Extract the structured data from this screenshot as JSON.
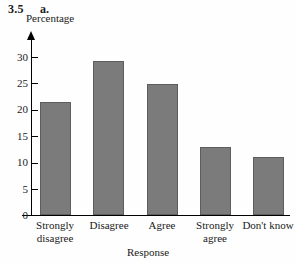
{
  "exercise": {
    "number": "3.5",
    "part": "a."
  },
  "chart_data": {
    "type": "bar",
    "title": "",
    "categories": [
      "Strongly disagree",
      "Disagree",
      "Agree",
      "Strongly agree",
      "Don't know"
    ],
    "category_lines": [
      [
        "Strongly",
        "disagree"
      ],
      [
        "Disagree",
        ""
      ],
      [
        "Agree",
        ""
      ],
      [
        "Strongly",
        "agree"
      ],
      [
        "Don't know",
        ""
      ]
    ],
    "values": [
      21.4,
      29.2,
      24.9,
      13.0,
      11.0
    ],
    "xlabel": "Response",
    "ylabel": "Percentage",
    "ylim": [
      0,
      32
    ],
    "yticks": [
      0,
      5,
      10,
      15,
      20,
      25,
      30
    ],
    "ytick_labels": [
      "0",
      "5",
      "10",
      "15",
      "20",
      "25",
      "30"
    ],
    "grid": false,
    "legend": false,
    "bar_color": "#7b7b7b",
    "bar_edge_color": "#5d5d5d",
    "axis_color": "#000000"
  }
}
